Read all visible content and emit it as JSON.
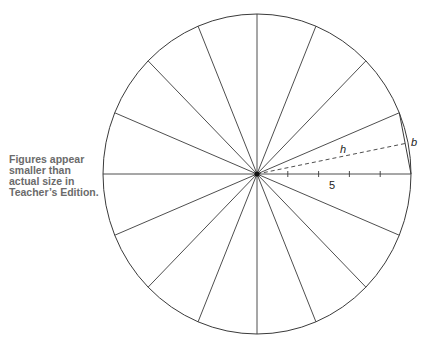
{
  "note": {
    "lines": [
      "Figures appear",
      "smaller than",
      "actual size in",
      "Teacher’s Edition."
    ]
  },
  "figure": {
    "sector_count": 16,
    "radius_label": "5",
    "height_label": "h",
    "base_label": "b",
    "radius_ticks": 4,
    "colors": {
      "stroke": "#3a3a3a",
      "text": "#222222",
      "note_text": "#6b6b6b"
    }
  }
}
